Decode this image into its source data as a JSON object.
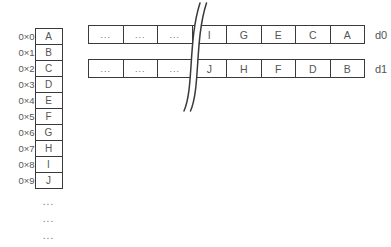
{
  "memory": {
    "rows": [
      {
        "address": "0×0",
        "value": "A"
      },
      {
        "address": "0×1",
        "value": "B"
      },
      {
        "address": "0×2",
        "value": "C"
      },
      {
        "address": "0×3",
        "value": "D"
      },
      {
        "address": "0×4",
        "value": "E"
      },
      {
        "address": "0×5",
        "value": "F"
      },
      {
        "address": "0×6",
        "value": "G"
      },
      {
        "address": "0×7",
        "value": "H"
      },
      {
        "address": "0×8",
        "value": "I"
      },
      {
        "address": "0×9",
        "value": "J"
      }
    ],
    "ellipses": [
      "...",
      "...",
      "..."
    ]
  },
  "registers": [
    {
      "label": "d0",
      "cells": [
        "...",
        "...",
        "...",
        "I",
        "G",
        "E",
        "C",
        "A"
      ]
    },
    {
      "label": "d1",
      "cells": [
        "...",
        "...",
        "...",
        "J",
        "H",
        "F",
        "D",
        "B"
      ]
    }
  ],
  "break_mark": "diagram-break",
  "colors": {
    "line": "#3a3a3a",
    "text": "#555555",
    "muted": "#6b6b6b",
    "background": "#ffffff"
  }
}
